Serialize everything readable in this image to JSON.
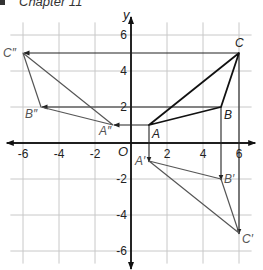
{
  "header": {
    "text": "Chapter 11"
  },
  "axes": {
    "x_label": "x",
    "y_label": "y",
    "origin_label": "O",
    "x_ticks": [
      {
        "value": -6,
        "label": "-6"
      },
      {
        "value": -4,
        "label": "-4"
      },
      {
        "value": -2,
        "label": "-2"
      },
      {
        "value": 2,
        "label": "2"
      },
      {
        "value": 4,
        "label": "4"
      },
      {
        "value": 6,
        "label": "6"
      }
    ],
    "y_ticks": [
      {
        "value": 6,
        "label": "6"
      },
      {
        "value": 4,
        "label": "4"
      },
      {
        "value": 2,
        "label": "2"
      },
      {
        "value": -2,
        "label": "-2"
      },
      {
        "value": -4,
        "label": "-4"
      },
      {
        "value": -6,
        "label": "-6"
      }
    ],
    "range": {
      "x": [
        -6.5,
        6.5
      ],
      "y": [
        -6.5,
        6.5
      ]
    },
    "grid": true
  },
  "triangles": {
    "original": {
      "name": "ABC",
      "vertices": [
        {
          "label": "A",
          "x": 1,
          "y": 1
        },
        {
          "label": "B",
          "x": 5,
          "y": 2
        },
        {
          "label": "C",
          "x": 6,
          "y": 5
        }
      ]
    },
    "reflect_x": {
      "name": "A'B'C'",
      "description": "Reflection of ABC across x-axis",
      "vertices": [
        {
          "label": "A′",
          "x": 1,
          "y": -1
        },
        {
          "label": "B′",
          "x": 5,
          "y": -2
        },
        {
          "label": "C′",
          "x": 6,
          "y": -5
        }
      ]
    },
    "reflect_y": {
      "name": "A''B''C''",
      "description": "Reflection of ABC across y-axis",
      "vertices": [
        {
          "label": "A″",
          "x": -1,
          "y": 1
        },
        {
          "label": "B″",
          "x": -5,
          "y": 2
        },
        {
          "label": "C″",
          "x": -6,
          "y": 5
        }
      ]
    }
  },
  "colors": {
    "original": "#111111",
    "image": "#555555",
    "grid": "#c8c8c8"
  }
}
